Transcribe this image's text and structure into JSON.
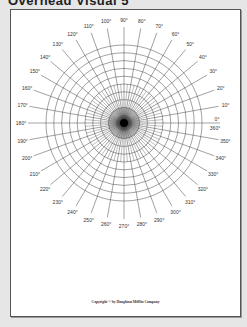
{
  "header": {
    "title": "Overhead Visual 5"
  },
  "polar_grid": {
    "concentric_circles": 10,
    "radial_spacing_degrees": 10,
    "line_color": "#444444",
    "angle_labels": [
      "0°",
      "10°",
      "20°",
      "30°",
      "40°",
      "50°",
      "60°",
      "70°",
      "80°",
      "90°",
      "100°",
      "110°",
      "120°",
      "130°",
      "140°",
      "150°",
      "160°",
      "170°",
      "180°",
      "190°",
      "200°",
      "210°",
      "220°",
      "230°",
      "240°",
      "250°",
      "260°",
      "270°",
      "280°",
      "290°",
      "300°",
      "310°",
      "320°",
      "330°",
      "340°",
      "350°"
    ],
    "zero_alt_label": "360°"
  },
  "footer": {
    "copyright": "Copyright © by Houghton Mifflin Company"
  }
}
